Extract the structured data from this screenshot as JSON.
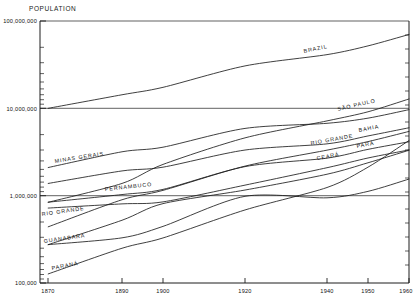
{
  "chart_data": {
    "type": "line",
    "title": "",
    "ylabel": "POPULATION",
    "xlabel": "",
    "yscale": "log",
    "ylim": [
      100000,
      100000000
    ],
    "xlim": [
      1870,
      1960
    ],
    "grid": true,
    "legend_position": "inline-labels",
    "ytick_labels": [
      "100,000",
      "1,000,000",
      "10,000,000",
      "100,000,000"
    ],
    "ytick_values": [
      100000,
      1000000,
      10000000,
      100000000
    ],
    "xtick_labels": [
      "1870",
      "1890",
      "1900",
      "1920",
      "1940",
      "1950",
      "1960"
    ],
    "xtick_values": [
      1870,
      1890,
      1900,
      1920,
      1940,
      1950,
      1960
    ],
    "series": [
      {
        "name": "BRAZIL",
        "label": "BRAZIL",
        "x": [
          1872,
          1890,
          1900,
          1920,
          1940,
          1950,
          1960
        ],
        "values": [
          10000000,
          14300000,
          17400000,
          30600000,
          41200000,
          51900000,
          70100000
        ]
      },
      {
        "name": "MINAS GERAIS",
        "label": "MINAS GERAIS",
        "x": [
          1872,
          1890,
          1900,
          1920,
          1940,
          1950,
          1960
        ],
        "values": [
          2100000,
          3180000,
          3590000,
          5890000,
          6740000,
          7720000,
          9660000
        ]
      },
      {
        "name": "SAO PAULO",
        "label": "SÃO PAULO",
        "x": [
          1872,
          1890,
          1900,
          1920,
          1940,
          1950,
          1960
        ],
        "values": [
          840000,
          1380000,
          2280000,
          4590000,
          7180000,
          9130000,
          12800000
        ]
      },
      {
        "name": "BAHIA",
        "label": "BAHIA",
        "x": [
          1872,
          1890,
          1900,
          1920,
          1940,
          1950,
          1960
        ],
        "values": [
          1380000,
          1920000,
          2120000,
          3330000,
          3920000,
          4830000,
          5990000
        ]
      },
      {
        "name": "RIO GRANDE",
        "label": "RIO GRANDE",
        "x": [
          1872,
          1890,
          1900,
          1920,
          1940,
          1950,
          1960
        ],
        "values": [
          440000,
          898000,
          1150000,
          2180000,
          3320000,
          4160000,
          5440000
        ]
      },
      {
        "name": "PERNAMBUCO",
        "label": "PERNAMBUCO",
        "x": [
          1872,
          1890,
          1900,
          1920,
          1940,
          1950,
          1960
        ],
        "values": [
          842000,
          1030000,
          1180000,
          2150000,
          2690000,
          3390000,
          4140000
        ]
      },
      {
        "name": "CEARA",
        "label": "CEARÁ",
        "x": [
          1872,
          1890,
          1900,
          1920,
          1940,
          1950,
          1960
        ],
        "values": [
          721000,
          805000,
          849000,
          1320000,
          2090000,
          2700000,
          3340000
        ]
      },
      {
        "name": "GUANABARA",
        "label": "GUANABARA",
        "x": [
          1872,
          1890,
          1900,
          1920,
          1940,
          1950,
          1960
        ],
        "values": [
          275000,
          523000,
          811000,
          1160000,
          1760000,
          2380000,
          3310000
        ]
      },
      {
        "name": "PARA",
        "label": "PARÁ",
        "x": [
          1872,
          1890,
          1900,
          1920,
          1940,
          1950,
          1960
        ],
        "values": [
          275000,
          329000,
          445000,
          983000,
          945000,
          1120000,
          1550000
        ]
      },
      {
        "name": "PARANA",
        "label": "PARANÁ",
        "x": [
          1872,
          1890,
          1900,
          1920,
          1940,
          1950,
          1960
        ],
        "values": [
          127000,
          250000,
          328000,
          686000,
          1240000,
          2120000,
          4280000
        ]
      }
    ]
  },
  "labels": {
    "population": "POPULATION",
    "y_100k": "100,000",
    "y_1m": "1,000,000",
    "y_10m": "10,000,000",
    "y_100m": "100,000,000",
    "x_1870": "1870",
    "x_1890": "1890",
    "x_1900": "1900",
    "x_1920": "1920",
    "x_1940": "1940",
    "x_1950": "1950",
    "x_1960": "1960",
    "s_brazil": "BRAZIL",
    "s_minas": "MINAS GERAIS",
    "s_saopaulo": "SÃO PAULO",
    "s_bahia": "BAHIA",
    "s_riogrande": "RIO GRANDE",
    "s_pernambuco": "PERNAMBUCO",
    "s_ceara": "CEARÁ",
    "s_guanabara": "GUANABARA",
    "s_para": "PARÁ",
    "s_parana": "PARANÁ"
  },
  "colors": {
    "ink": "#1d1d1d",
    "background": "#ffffff"
  }
}
